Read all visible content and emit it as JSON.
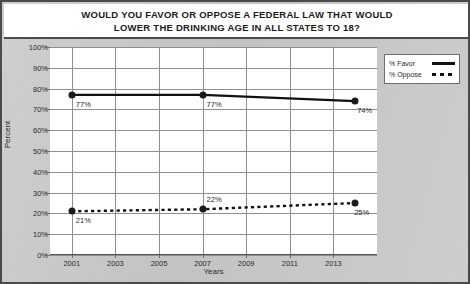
{
  "chart_data": {
    "type": "line",
    "title": "WOULD YOU FAVOR OR OPPOSE A FEDERAL LAW THAT WOULD LOWER THE DRINKING AGE IN ALL STATES TO 18?",
    "title_lines": [
      "WOULD YOU FAVOR OR OPPOSE A FEDERAL LAW THAT WOULD",
      "LOWER THE DRINKING AGE IN ALL STATES TO 18?"
    ],
    "xlabel": "Years",
    "ylabel": "Percent",
    "ylim": [
      0,
      100
    ],
    "xlim": [
      2000,
      2015
    ],
    "ytick_labels": [
      "100%",
      "90%",
      "80%",
      "70%",
      "60%",
      "50%",
      "40%",
      "30%",
      "20%",
      "10%",
      "0%"
    ],
    "ytick_values": [
      100,
      90,
      80,
      70,
      60,
      50,
      40,
      30,
      20,
      10,
      0
    ],
    "xtick_labels": [
      "2001",
      "2003",
      "2005",
      "2007",
      "2009",
      "2011",
      "2013"
    ],
    "xtick_values": [
      2001,
      2003,
      2005,
      2007,
      2009,
      2011,
      2013
    ],
    "grid": true,
    "legend_position": "top-right",
    "x": [
      2001,
      2007,
      2014
    ],
    "series": [
      {
        "name": "% Favor",
        "style": "solid",
        "values": [
          77,
          77,
          74
        ],
        "point_labels": [
          "77%",
          "77%",
          "74%"
        ]
      },
      {
        "name": "% Oppose",
        "style": "dashed",
        "values": [
          21,
          22,
          25
        ],
        "point_labels": [
          "21%",
          "22%",
          "25%"
        ]
      }
    ],
    "legend": [
      {
        "label": "% Favor",
        "style": "solid"
      },
      {
        "label": "% Oppose",
        "style": "dashed"
      }
    ],
    "colors": {
      "line": "#111111",
      "plot_background": "#ffffff",
      "figure_background": "#c9c9c9",
      "gridline": "#8f8f8f",
      "text": "#2b2b2b",
      "border": "#4a4a4a"
    }
  }
}
